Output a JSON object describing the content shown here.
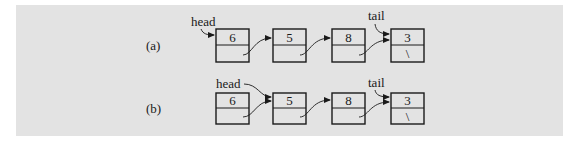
{
  "figure": {
    "panel_color": "#e3e3e3",
    "rows": [
      {
        "label": "(a)",
        "head_label": "head",
        "tail_label": "tail",
        "nodes": [
          {
            "value": "6",
            "next": ""
          },
          {
            "value": "5",
            "next": ""
          },
          {
            "value": "8",
            "next": ""
          },
          {
            "value": "3",
            "next": "\\"
          }
        ],
        "head_points_to": "6",
        "tail_points_to": "3"
      },
      {
        "label": "(b)",
        "head_label": "head",
        "tail_label": "tail",
        "nodes": [
          {
            "value": "6",
            "next": ""
          },
          {
            "value": "5",
            "next": ""
          },
          {
            "value": "8",
            "next": ""
          },
          {
            "value": "3",
            "next": "\\"
          }
        ],
        "head_points_to": "5",
        "tail_points_to": "3"
      }
    ]
  }
}
